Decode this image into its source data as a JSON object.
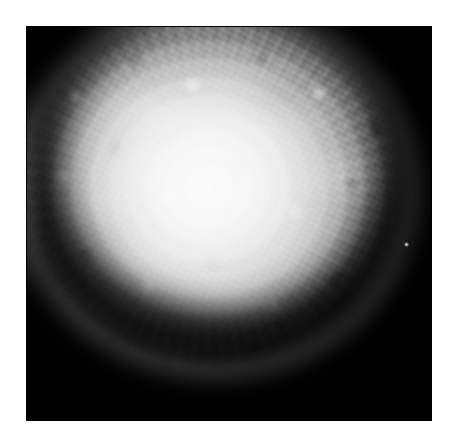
{
  "page": {
    "background_color": "#ffffff",
    "width": 458,
    "height": 448,
    "alt_text": ""
  },
  "figure": {
    "kind": "grayscale-photograph",
    "caption": "",
    "label": "",
    "frame": {
      "background_color": "#050505",
      "left": 26,
      "top": 26,
      "width": 406,
      "height": 395
    },
    "specimen": {
      "name": "sphere",
      "center_x_pct": 45,
      "center_y_pct": 41,
      "highlight_color": "#fcfcfc",
      "midtone_color": "#bcbcbc",
      "shadow_color": "#0a0a0a",
      "features": [
        "bright diffuse core above center-left",
        "concentric ripple texture radiating from core",
        "fine granular mottling across the surface",
        "dark crescent shadow along the lower limb",
        "faint re-illuminated rim beneath the shadow",
        "small specular speck on the right limb"
      ]
    }
  }
}
